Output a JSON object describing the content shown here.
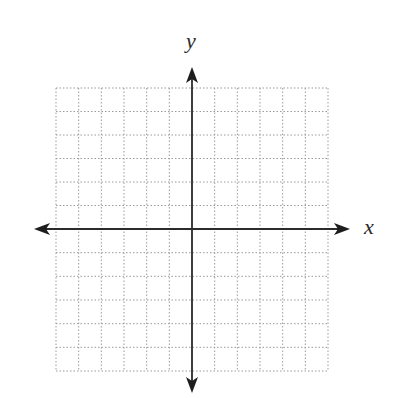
{
  "diagram": {
    "type": "blank-coordinate-plane",
    "axes": {
      "x_label": "x",
      "y_label": "y",
      "arrows": "both-ends"
    },
    "grid": {
      "columns": 12,
      "rows": 12,
      "cells_left_of_y_axis": 6,
      "cells_right_of_y_axis": 6,
      "cells_above_x_axis": 6,
      "cells_below_x_axis": 6,
      "line_style": "dotted"
    },
    "colors": {
      "axis": "#2b2b2b",
      "grid": "#9a9a9a",
      "label": "#2a2a2a",
      "background": "#ffffff"
    }
  }
}
